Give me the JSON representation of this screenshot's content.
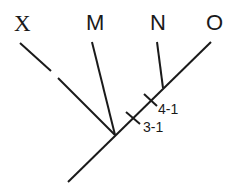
{
  "diagram": {
    "type": "cladogram",
    "taxa": [
      {
        "id": "X",
        "label": "X"
      },
      {
        "id": "M",
        "label": "M"
      },
      {
        "id": "N",
        "label": "N"
      },
      {
        "id": "O",
        "label": "O"
      }
    ],
    "annotations": [
      {
        "id": "char-4-1",
        "label": "4-1"
      },
      {
        "id": "char-3-1",
        "label": "3-1"
      }
    ],
    "colors": {
      "line": "#1a1a1a",
      "background": "#ffffff"
    }
  }
}
